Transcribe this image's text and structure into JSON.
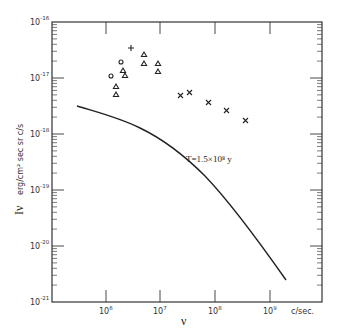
{
  "chart_data": {
    "type": "scatter",
    "title": "",
    "xlabel": "ν",
    "xunits": "c/sec.",
    "ylabel": "Iν",
    "yunits": "erg/cm² sec sr c/s",
    "xscale": "log",
    "yscale": "log",
    "xlim": [
      200000.0,
      10000000000.0
    ],
    "ylim": [
      1e-21,
      1e-16
    ],
    "grid": false,
    "x_tick_labels": [
      "10^6",
      "10^7",
      "10^8",
      "10^9"
    ],
    "y_tick_labels": [
      "10^-16",
      "10^-17",
      "10^-18",
      "10^-19",
      "10^-20",
      "10^-21"
    ],
    "annotation": "T = 1.5×10⁸ y",
    "series": [
      {
        "name": "plus",
        "marker": "+",
        "points": [
          [
            3000000.0,
            3.2e-17
          ]
        ]
      },
      {
        "name": "circle",
        "marker": "o",
        "points": [
          [
            2000000.0,
            1.7e-17
          ],
          [
            1300000.0,
            9.5e-18
          ]
        ]
      },
      {
        "name": "triangle",
        "marker": "△",
        "points": [
          [
            2100000.0,
            1.3e-17
          ],
          [
            2300000.0,
            1.1e-17
          ],
          [
            1600000.0,
            6.5e-18
          ],
          [
            1600000.0,
            4.5e-18
          ],
          [
            5300000.0,
            2.6e-17
          ],
          [
            5300000.0,
            1.8e-17
          ],
          [
            9000000.0,
            1.8e-17
          ],
          [
            9000000.0,
            1.3e-17
          ]
        ]
      },
      {
        "name": "cross",
        "marker": "×",
        "points": [
          [
            23000000.0,
            4.9e-18
          ],
          [
            33000000.0,
            5.6e-18
          ],
          [
            70000000.0,
            3.5e-18
          ],
          [
            140000000.0,
            2.5e-18
          ],
          [
            300000000.0,
            1.7e-18
          ]
        ]
      },
      {
        "name": "T=1.5e8 y",
        "type": "line",
        "points": [
          [
            350000.0,
            3e-18
          ],
          [
            1000000.0,
            1.9e-18
          ],
          [
            3000000.0,
            1e-18
          ],
          [
            10000000.0,
            5e-19
          ],
          [
            30000000.0,
            1.3e-19
          ],
          [
            100000000.0,
            2.5e-20
          ],
          [
            300000000.0,
            4.5e-21
          ],
          [
            1500000000.0,
            4e-22
          ]
        ]
      }
    ]
  },
  "labels": {
    "x_title": "ν",
    "x_units": "c/sec.",
    "y_title": "Iν",
    "y_units": "erg/cm² sec sr c/s",
    "curve_label": "T=1.5×10⁸ y",
    "xticks": [
      {
        "base": "10",
        "exp": "6"
      },
      {
        "base": "10",
        "exp": "7"
      },
      {
        "base": "10",
        "exp": "8"
      },
      {
        "base": "10",
        "exp": "9"
      }
    ],
    "yticks": [
      {
        "base": "10",
        "exp": "-16"
      },
      {
        "base": "10",
        "exp": "-17"
      },
      {
        "base": "10",
        "exp": "-18"
      },
      {
        "base": "10",
        "exp": "-19"
      },
      {
        "base": "10",
        "exp": "-20"
      },
      {
        "base": "10",
        "exp": "-21"
      }
    ]
  }
}
